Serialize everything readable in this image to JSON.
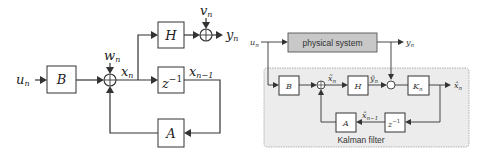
{
  "left_diagram": {
    "title": "State-space system model",
    "blocks": {
      "B": "B",
      "H": "H",
      "z_inv": "z",
      "z_inv_exp": "−1",
      "A": "A"
    },
    "signals": {
      "u_n": {
        "base": "u",
        "sub": "n"
      },
      "w_n": {
        "base": "w",
        "sub": "n"
      },
      "x_n": {
        "base": "x",
        "sub": "n"
      },
      "v_n": {
        "base": "v",
        "sub": "n"
      },
      "y_n": {
        "base": "y",
        "sub": "n"
      },
      "x_n_minus_1": {
        "base": "x",
        "sub": "n−1"
      }
    }
  },
  "right_diagram": {
    "title": "Kalman filter structure",
    "physical_system_label": "physical system",
    "kalman_filter_label": "Kalman filter",
    "colors": {
      "physical_system_fill": "#c8c8c8",
      "kalman_region_fill": "#ececec",
      "kalman_region_border": "#a0a0a0"
    },
    "blocks": {
      "B": "B",
      "H": "H",
      "K": {
        "base": "K",
        "sub": "n"
      },
      "z_inv": "z",
      "z_inv_exp": "−1",
      "A": "A"
    },
    "signals": {
      "u_n": {
        "base": "u",
        "sub": "n"
      },
      "y_n": {
        "base": "y",
        "sub": "n"
      },
      "x_hat_n_pred": {
        "base": "x̃",
        "sub": "n"
      },
      "y_hat_n": {
        "base": "ỹ",
        "sub": "n"
      },
      "x_hat_n": {
        "base": "x̂",
        "sub": "n"
      },
      "x_hat_n_minus_1": {
        "base": "x̂",
        "sub": "n−1"
      }
    }
  }
}
